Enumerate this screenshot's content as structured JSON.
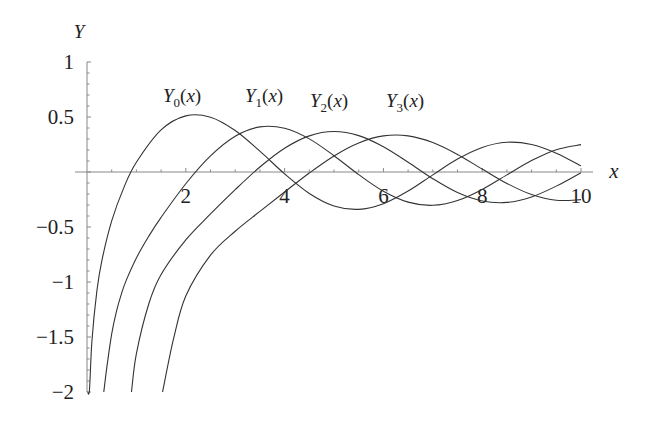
{
  "chart_data": {
    "type": "line",
    "title": "",
    "xlabel": "x",
    "ylabel": "Y",
    "xlim": [
      0,
      10
    ],
    "ylim": [
      -2,
      1
    ],
    "grid": false,
    "legend": "inline labels above curves",
    "x_ticks": [
      {
        "v": 2,
        "label": "2"
      },
      {
        "v": 4,
        "label": "4"
      },
      {
        "v": 6,
        "label": "6"
      },
      {
        "v": 8,
        "label": "8"
      },
      {
        "v": 10,
        "label": "10"
      }
    ],
    "y_ticks": [
      {
        "v": 1,
        "label": "1"
      },
      {
        "v": 0.5,
        "label": "0.5"
      },
      {
        "v": -0.5,
        "label": "−0.5"
      },
      {
        "v": -1,
        "label": "−1"
      },
      {
        "v": -1.5,
        "label": "−1.5"
      },
      {
        "v": -2,
        "label": "−2"
      }
    ],
    "series": [
      {
        "name": "Y0(x)",
        "sub": "0",
        "x": [
          0.012,
          0.05,
          0.1,
          0.2,
          0.3,
          0.5,
          0.75,
          1,
          1.5,
          2,
          2.5,
          3,
          3.5,
          4,
          4.5,
          5,
          5.5,
          6,
          6.5,
          7,
          7.5,
          8,
          8.5,
          9,
          9.5,
          10
        ],
        "y": [
          -2.0,
          -1.979,
          -1.5342,
          -1.0811,
          -0.8073,
          -0.4445,
          -0.1372,
          0.0883,
          0.3824,
          0.5104,
          0.4981,
          0.3769,
          0.189,
          -0.0169,
          -0.1947,
          -0.3085,
          -0.3395,
          -0.2882,
          -0.1732,
          -0.0259,
          0.1173,
          0.2235,
          0.2702,
          0.2499,
          0.1712,
          0.0557
        ]
      },
      {
        "name": "Y1(x)",
        "sub": "1",
        "x": [
          0.34,
          0.4,
          0.5,
          0.6,
          0.7,
          0.8,
          1,
          1.25,
          1.5,
          2,
          2.5,
          3,
          3.5,
          4,
          4.5,
          5,
          5.5,
          6,
          6.5,
          7,
          7.5,
          8,
          8.5,
          9,
          9.5,
          10
        ],
        "y": [
          -2.0,
          -1.7809,
          -1.4715,
          -1.2604,
          -1.1032,
          -0.9781,
          -0.7812,
          -0.5844,
          -0.4123,
          -0.107,
          0.1459,
          0.3247,
          0.4102,
          0.3979,
          0.301,
          0.1479,
          -0.0238,
          -0.175,
          -0.2741,
          -0.3027,
          -0.2591,
          -0.1581,
          -0.0262,
          0.1043,
          0.2032,
          0.249
        ]
      },
      {
        "name": "Y2(x)",
        "sub": "2",
        "x": [
          0.9,
          1,
          1.25,
          1.5,
          2,
          2.5,
          3,
          3.5,
          4,
          4.5,
          5,
          5.5,
          6,
          6.5,
          7,
          7.5,
          8,
          8.5,
          9,
          9.5,
          10
        ],
        "y": [
          -2.0,
          -1.6507,
          -1.2,
          -0.9321,
          -0.6174,
          -0.3814,
          -0.1604,
          0.0454,
          0.2159,
          0.3285,
          0.3677,
          0.3308,
          0.2299,
          0.0889,
          -0.0606,
          -0.1864,
          -0.263,
          -0.2764,
          -0.2267,
          -0.1284,
          -0.0059
        ]
      },
      {
        "name": "Y3(x)",
        "sub": "3",
        "x": [
          1.53,
          1.75,
          2,
          2.5,
          3,
          3.5,
          4,
          4.5,
          5,
          5.5,
          6,
          6.5,
          7,
          7.5,
          8,
          8.5,
          9,
          9.5,
          10
        ],
        "y": [
          -2.0,
          -1.52,
          -1.1278,
          -0.7561,
          -0.5386,
          -0.3583,
          -0.182,
          -0.009,
          0.1463,
          0.2644,
          0.3283,
          0.3288,
          0.2681,
          0.1597,
          0.0266,
          -0.1039,
          -0.2051,
          -0.2573,
          -0.2514
        ]
      }
    ],
    "annotations": [
      {
        "text": "Y",
        "sub": "0",
        "tail": "(x)",
        "x": 163,
        "y": 102
      },
      {
        "text": "Y",
        "sub": "1",
        "tail": "(x)",
        "x": 245,
        "y": 102
      },
      {
        "text": "Y",
        "sub": "2",
        "tail": "(x)",
        "x": 310,
        "y": 107
      },
      {
        "text": "Y",
        "sub": "3",
        "tail": "(x)",
        "x": 386,
        "y": 107
      }
    ]
  }
}
